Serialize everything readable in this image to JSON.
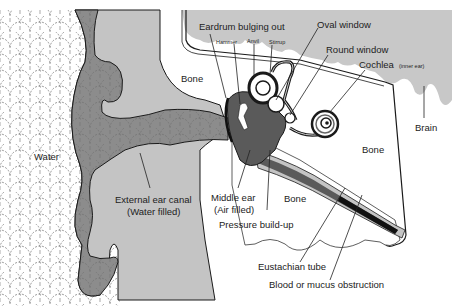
{
  "diagram": {
    "colors": {
      "water_bg": "#ffffff",
      "water_pattern": "#555555",
      "tissue": "#c4c4c4",
      "canal": "#8c8c8c",
      "brain": "#c8c8c8",
      "middle_ear": "#5a5a5a",
      "outline": "#1a1a1a"
    },
    "labels": {
      "water": "Water",
      "bone_upper": "Bone",
      "bone_right": "Bone",
      "bone_lower": "Bone",
      "brain": "Brain",
      "eardrum": "Eardrum bulging out",
      "hammer": "Hammer",
      "anvil": "Anvil",
      "stirrup": "Stirrup",
      "oval_window": "Oval window",
      "round_window": "Round window",
      "cochlea": "Cochlea",
      "cochlea_note": "(inner ear)",
      "external_canal_1": "External ear canal",
      "external_canal_2": "(Water filled)",
      "middle_ear_1": "Middle ear",
      "middle_ear_2": "(Air filled)",
      "pressure": "Pressure build-up",
      "eustachian": "Eustachian tube",
      "obstruction": "Blood or mucus obstruction"
    }
  }
}
